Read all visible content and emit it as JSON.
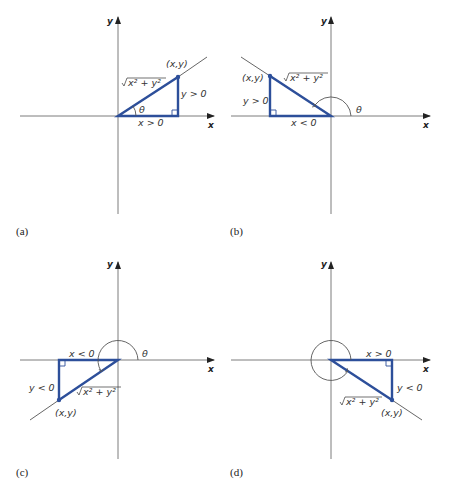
{
  "figure": {
    "axis_x_label": "x",
    "axis_y_label": "y",
    "point_label": "(x,y)",
    "hyp_label": "x² + y²",
    "theta_label": "θ",
    "panels": [
      {
        "caption": "(a)",
        "x_label": "x > 0",
        "y_label": "y > 0",
        "quadrant": "I"
      },
      {
        "caption": "(b)",
        "x_label": "x < 0",
        "y_label": "y > 0",
        "quadrant": "II"
      },
      {
        "caption": "(c)",
        "x_label": "x < 0",
        "y_label": "y < 0",
        "quadrant": "III"
      },
      {
        "caption": "(d)",
        "x_label": "x > 0",
        "y_label": "y < 0",
        "quadrant": "IV"
      }
    ]
  },
  "colors": {
    "triangle": "#2d4f9a",
    "axes": "#6e6e6e"
  }
}
